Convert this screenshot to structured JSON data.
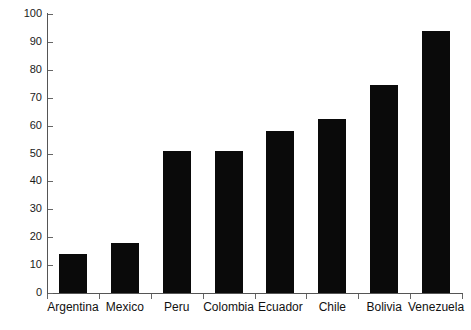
{
  "chart_data": {
    "type": "bar",
    "title": "",
    "subtitle": "",
    "xlabel": "",
    "ylabel": "",
    "categories": [
      "Argentina",
      "Mexico",
      "Peru",
      "Colombia",
      "Ecuador",
      "Chile",
      "Bolivia",
      "Venezuela"
    ],
    "values": [
      14,
      18,
      51,
      51,
      58,
      62.5,
      74.5,
      94
    ],
    "ylim": [
      0,
      100
    ],
    "yticks": [
      0,
      10,
      20,
      30,
      40,
      50,
      60,
      70,
      80,
      90,
      100
    ],
    "ytick_labels": [
      "0",
      "10",
      "20",
      "30",
      "40",
      "50",
      "60",
      "70",
      "80",
      "90",
      "100"
    ],
    "grid": false,
    "legend": false,
    "legend_position": "none",
    "bar_color": "#0a0a0a",
    "axis_color": "#555555",
    "background_color": "#ffffff"
  }
}
